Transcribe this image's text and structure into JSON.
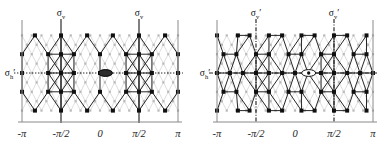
{
  "figure": {
    "background": "#ffffff",
    "panels": [
      {
        "id": "left-panel",
        "name": "hexagonal-lattice-panel",
        "lattice_type": "honeycomb",
        "axis": {
          "ticks": [
            {
              "label": "-π",
              "x": -3.14159
            },
            {
              "label": "-π/2",
              "x": -1.5708
            },
            {
              "label": "0",
              "x": 0
            },
            {
              "label": "π/2",
              "x": 1.5708
            },
            {
              "label": "π",
              "x": 3.14159
            }
          ],
          "xlim": [
            -3.14159,
            3.14159
          ],
          "grid": false
        },
        "symmetry_labels": [
          {
            "base": "σ",
            "sub": "v",
            "prime": "",
            "name": "sigma-v-left",
            "x": -1.5708,
            "position": "top"
          },
          {
            "base": "σ",
            "sub": "v",
            "prime": "",
            "name": "sigma-v-right",
            "x": 1.5708,
            "position": "top"
          },
          {
            "base": "σ",
            "sub": "h",
            "prime": "′",
            "name": "sigma-h-prime",
            "x": -3.14159,
            "position": "left"
          }
        ],
        "mirror_lines": [
          {
            "orientation": "vertical",
            "x": -1.5708,
            "style": "solid"
          },
          {
            "orientation": "vertical",
            "x": 1.5708,
            "style": "solid"
          },
          {
            "orientation": "horizontal",
            "y": 0,
            "style": "dotted"
          }
        ],
        "marker": {
          "shape": "filled-ellipse",
          "x": 0.22,
          "y": 0,
          "fill": "#2b2b2b",
          "stroke": "#000000"
        },
        "colors": {
          "bold_node": "#101010",
          "bold_edge": "#1a1a1a",
          "faint_node": "#b9b9b9",
          "faint_edge": "#c8c8c8",
          "frame": "#8a8a8a"
        }
      },
      {
        "id": "right-panel",
        "name": "distorted-lattice-panel",
        "lattice_type": "columnar-zigzag",
        "axis": {
          "ticks": [
            {
              "label": "-π",
              "x": -3.14159
            },
            {
              "label": "-π/2",
              "x": -1.5708
            },
            {
              "label": "0",
              "x": 0
            },
            {
              "label": "π/2",
              "x": 1.5708
            },
            {
              "label": "π",
              "x": 3.14159
            }
          ],
          "xlim": [
            -3.14159,
            3.14159
          ],
          "grid": false
        },
        "symmetry_labels": [
          {
            "base": "σ",
            "sub": "v",
            "prime": "′",
            "name": "sigma-v-prime-left",
            "x": -1.5708,
            "position": "top"
          },
          {
            "base": "σ",
            "sub": "v",
            "prime": "′",
            "name": "sigma-v-prime-right",
            "x": 1.5708,
            "position": "top"
          },
          {
            "base": "σ",
            "sub": "h",
            "prime": "′",
            "name": "sigma-h-prime",
            "x": -3.14159,
            "position": "left"
          }
        ],
        "mirror_lines": [
          {
            "orientation": "vertical",
            "x": -1.5708,
            "style": "dash-dot"
          },
          {
            "orientation": "vertical",
            "x": 1.5708,
            "style": "dash-dot"
          },
          {
            "orientation": "horizontal",
            "y": 0,
            "style": "dash-dot"
          }
        ],
        "marker": {
          "shape": "open-ellipse-with-dot",
          "x": 0.55,
          "y": 0,
          "fill": "#ffffff",
          "stroke": "#151515"
        },
        "colors": {
          "bold_node": "#101010",
          "bold_edge": "#1a1a1a",
          "faint_node": "#b9b9b9",
          "faint_edge": "#c8c8c8",
          "frame": "#8a8a8a"
        }
      }
    ]
  },
  "chart_data": {
    "type": "scatter",
    "title": "",
    "xlabel": "",
    "ylabel": "",
    "xlim": [
      -3.14159,
      3.14159
    ],
    "ylim": [
      -1.15,
      1.15
    ],
    "grid": false,
    "legend": "none",
    "xtick_labels": [
      "-π",
      "-π/2",
      "0",
      "π/2",
      "π"
    ],
    "xtick_values": [
      -3.14159,
      -1.5708,
      0,
      1.5708,
      3.14159
    ],
    "annotations": [
      "σv",
      "σv",
      "σh′",
      "σv′",
      "σv′",
      "σh′"
    ],
    "series": [
      {
        "name": "left-panel-bold-nodes",
        "panel": 0,
        "marker": "square",
        "color": "#101010",
        "points": [
          [
            -2.62,
            0.92
          ],
          [
            -1.57,
            0.92
          ],
          [
            -0.52,
            0.92
          ],
          [
            0.52,
            0.92
          ],
          [
            1.57,
            0.92
          ],
          [
            2.62,
            0.92
          ],
          [
            -3.14,
            0.46
          ],
          [
            -2.09,
            0.46
          ],
          [
            -1.57,
            0.46
          ],
          [
            -1.05,
            0.46
          ],
          [
            0.0,
            0.46
          ],
          [
            1.05,
            0.46
          ],
          [
            1.57,
            0.46
          ],
          [
            2.09,
            0.46
          ],
          [
            3.14,
            0.46
          ],
          [
            -3.14,
            0.0
          ],
          [
            -2.09,
            0.0
          ],
          [
            -1.57,
            0.0
          ],
          [
            -1.05,
            0.0
          ],
          [
            0.0,
            0.0
          ],
          [
            1.05,
            0.0
          ],
          [
            1.57,
            0.0
          ],
          [
            2.09,
            0.0
          ],
          [
            3.14,
            0.0
          ],
          [
            -3.14,
            -0.46
          ],
          [
            -2.09,
            -0.46
          ],
          [
            -1.57,
            -0.46
          ],
          [
            -1.05,
            -0.46
          ],
          [
            0.0,
            -0.46
          ],
          [
            1.05,
            -0.46
          ],
          [
            1.57,
            -0.46
          ],
          [
            2.09,
            -0.46
          ],
          [
            3.14,
            -0.46
          ],
          [
            -2.62,
            -0.92
          ],
          [
            -1.57,
            -0.92
          ],
          [
            -0.52,
            -0.92
          ],
          [
            0.52,
            -0.92
          ],
          [
            1.57,
            -0.92
          ],
          [
            2.62,
            -0.92
          ]
        ]
      },
      {
        "name": "right-panel-bold-nodes",
        "panel": 1,
        "marker": "square",
        "color": "#101010",
        "points": [
          [
            -3.14,
            0.92
          ],
          [
            -2.3,
            0.92
          ],
          [
            -1.83,
            0.92
          ],
          [
            -1.05,
            0.92
          ],
          [
            -0.52,
            0.92
          ],
          [
            0.26,
            0.92
          ],
          [
            0.79,
            0.92
          ],
          [
            1.57,
            0.92
          ],
          [
            2.1,
            0.92
          ],
          [
            2.88,
            0.92
          ],
          [
            -2.88,
            0.46
          ],
          [
            -2.36,
            0.46
          ],
          [
            -1.57,
            0.46
          ],
          [
            -1.05,
            0.46
          ],
          [
            -0.26,
            0.46
          ],
          [
            0.26,
            0.46
          ],
          [
            1.05,
            0.46
          ],
          [
            1.57,
            0.46
          ],
          [
            2.36,
            0.46
          ],
          [
            2.88,
            0.46
          ],
          [
            -3.14,
            0.0
          ],
          [
            -2.62,
            0.0
          ],
          [
            -2.1,
            0.0
          ],
          [
            -1.57,
            0.0
          ],
          [
            -1.05,
            0.0
          ],
          [
            -0.52,
            0.0
          ],
          [
            0.0,
            0.0
          ],
          [
            0.52,
            0.0
          ],
          [
            1.05,
            0.0
          ],
          [
            1.57,
            0.0
          ],
          [
            2.1,
            0.0
          ],
          [
            2.62,
            0.0
          ],
          [
            3.14,
            0.0
          ],
          [
            -2.88,
            -0.46
          ],
          [
            -2.36,
            -0.46
          ],
          [
            -1.57,
            -0.46
          ],
          [
            -1.05,
            -0.46
          ],
          [
            -0.26,
            -0.46
          ],
          [
            0.26,
            -0.46
          ],
          [
            1.05,
            -0.46
          ],
          [
            1.57,
            -0.46
          ],
          [
            2.36,
            -0.46
          ],
          [
            2.88,
            -0.46
          ],
          [
            -3.14,
            -0.92
          ],
          [
            -2.3,
            -0.92
          ],
          [
            -1.83,
            -0.92
          ],
          [
            -1.05,
            -0.92
          ],
          [
            -0.52,
            -0.92
          ],
          [
            0.26,
            -0.92
          ],
          [
            0.79,
            -0.92
          ],
          [
            1.57,
            -0.92
          ],
          [
            2.1,
            -0.92
          ],
          [
            2.88,
            -0.92
          ]
        ]
      }
    ]
  }
}
